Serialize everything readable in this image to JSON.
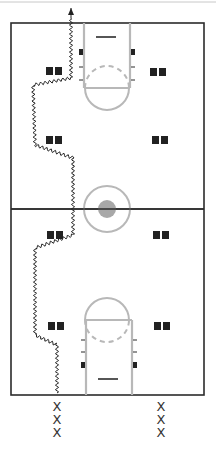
{
  "diagram": {
    "colors": {
      "court_line": "#2b2b2b",
      "key_line": "#b8b8b8",
      "player": "#222222",
      "path": "#222222",
      "center_dot": "#a8a8a8",
      "top_rule": "#c8c8c8"
    },
    "court": {
      "x": 11,
      "y": 23,
      "width": 193,
      "height": 372,
      "midcourt_y": 209
    },
    "center_circle": {
      "cx": 107,
      "cy": 209,
      "r": 23,
      "inner_r": 9
    },
    "top_key": {
      "lane_left_x": 84,
      "lane_right_x": 130,
      "baseline_y": 23,
      "ft_line_y": 88,
      "ft_circle": {
        "cx": 107,
        "cy": 98,
        "r": 22
      },
      "backboard": {
        "x1": 96,
        "x2": 116,
        "y": 37
      },
      "blocks_y": 52,
      "hashes_y": [
        67,
        80
      ]
    },
    "bottom_key": {
      "lane_left_x": 86,
      "lane_right_x": 132,
      "baseline_y": 395,
      "ft_line_y": 320,
      "ft_circle": {
        "cx": 107,
        "cy": 310,
        "r": 22
      },
      "backboard": {
        "x1": 98,
        "x2": 118,
        "y": 379
      },
      "blocks_y": 365,
      "hashes_y": [
        340,
        352
      ]
    },
    "players": [
      {
        "label": "defender-pair",
        "x": 46,
        "y": 67
      },
      {
        "label": "defender-pair",
        "x": 150,
        "y": 68
      },
      {
        "label": "defender-pair",
        "x": 46,
        "y": 136
      },
      {
        "label": "defender-pair",
        "x": 152,
        "y": 136
      },
      {
        "label": "defender-pair",
        "x": 47,
        "y": 231
      },
      {
        "label": "defender-pair",
        "x": 153,
        "y": 231
      },
      {
        "label": "defender-pair",
        "x": 48,
        "y": 322
      },
      {
        "label": "defender-pair",
        "x": 154,
        "y": 322
      }
    ],
    "dribble_path": {
      "description": "zig-zag dribble route up the left side",
      "points": [
        [
          57,
          393
        ],
        [
          57,
          345
        ],
        [
          35,
          335
        ],
        [
          35,
          248
        ],
        [
          73,
          235
        ],
        [
          73,
          158
        ],
        [
          35,
          145
        ],
        [
          33,
          85
        ],
        [
          71,
          78
        ],
        [
          71,
          8
        ]
      ],
      "arrow_tip": {
        "x": 71,
        "y": 8
      }
    },
    "lines": [
      {
        "name": "left-line",
        "x": 57,
        "marks": [
          "X",
          "X",
          "X"
        ],
        "ys": [
          406,
          419,
          432
        ]
      },
      {
        "name": "right-line",
        "x": 161,
        "marks": [
          "X",
          "X",
          "X"
        ],
        "ys": [
          406,
          419,
          432
        ]
      }
    ]
  }
}
